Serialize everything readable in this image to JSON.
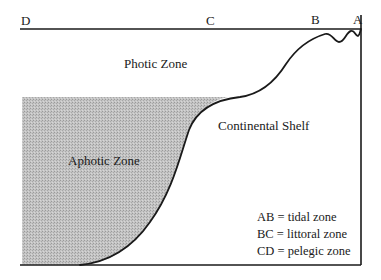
{
  "diagram": {
    "points": {
      "D": "D",
      "C": "C",
      "B": "B",
      "A": "A"
    },
    "zones": {
      "photic": "Photic Zone",
      "aphotic": "Aphotic Zone",
      "shelf": "Continental Shelf"
    },
    "legend": [
      "AB = tidal zone",
      "BC = littoral zone",
      "CD = pelegic zone"
    ],
    "colors": {
      "line": "#1a1a1a",
      "shade": "#b8b8b8",
      "background": "#ffffff"
    }
  }
}
